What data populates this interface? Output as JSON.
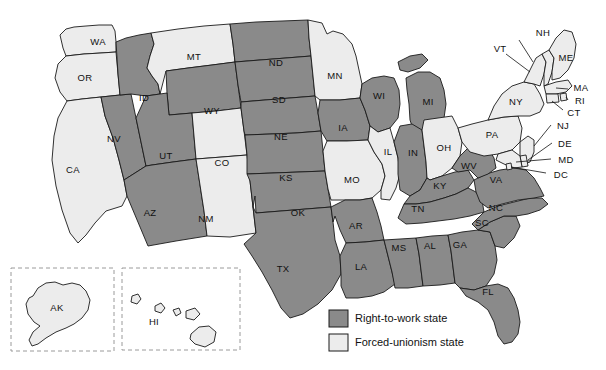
{
  "map": {
    "title": "Right-to-work states map of the United States",
    "colors": {
      "right_to_work": "#8a8a8a",
      "forced_unionism": "#ececec",
      "border": "#1a1a1a"
    },
    "legend": {
      "items": [
        {
          "label": "Right-to-work state",
          "color": "#8a8a8a"
        },
        {
          "label": "Forced-unionism state",
          "color": "#ececec"
        }
      ]
    },
    "insets": [
      {
        "name": "AK"
      },
      {
        "name": "HI"
      }
    ],
    "states": [
      {
        "code": "WA",
        "status": "forced"
      },
      {
        "code": "OR",
        "status": "forced"
      },
      {
        "code": "CA",
        "status": "forced"
      },
      {
        "code": "NV",
        "status": "rtw"
      },
      {
        "code": "ID",
        "status": "rtw"
      },
      {
        "code": "MT",
        "status": "forced"
      },
      {
        "code": "WY",
        "status": "rtw"
      },
      {
        "code": "UT",
        "status": "rtw"
      },
      {
        "code": "AZ",
        "status": "rtw"
      },
      {
        "code": "CO",
        "status": "forced"
      },
      {
        "code": "NM",
        "status": "forced"
      },
      {
        "code": "ND",
        "status": "rtw"
      },
      {
        "code": "SD",
        "status": "rtw"
      },
      {
        "code": "NE",
        "status": "rtw"
      },
      {
        "code": "KS",
        "status": "rtw"
      },
      {
        "code": "OK",
        "status": "rtw"
      },
      {
        "code": "TX",
        "status": "rtw"
      },
      {
        "code": "MN",
        "status": "forced"
      },
      {
        "code": "IA",
        "status": "rtw"
      },
      {
        "code": "MO",
        "status": "forced"
      },
      {
        "code": "AR",
        "status": "rtw"
      },
      {
        "code": "LA",
        "status": "rtw"
      },
      {
        "code": "WI",
        "status": "rtw"
      },
      {
        "code": "IL",
        "status": "forced"
      },
      {
        "code": "MS",
        "status": "rtw"
      },
      {
        "code": "AL",
        "status": "rtw"
      },
      {
        "code": "MI",
        "status": "rtw"
      },
      {
        "code": "IN",
        "status": "rtw"
      },
      {
        "code": "OH",
        "status": "forced"
      },
      {
        "code": "KY",
        "status": "rtw"
      },
      {
        "code": "TN",
        "status": "rtw"
      },
      {
        "code": "GA",
        "status": "rtw"
      },
      {
        "code": "FL",
        "status": "rtw"
      },
      {
        "code": "SC",
        "status": "rtw"
      },
      {
        "code": "NC",
        "status": "rtw"
      },
      {
        "code": "VA",
        "status": "rtw"
      },
      {
        "code": "WV",
        "status": "rtw"
      },
      {
        "code": "PA",
        "status": "forced"
      },
      {
        "code": "NY",
        "status": "forced"
      },
      {
        "code": "VT",
        "status": "forced"
      },
      {
        "code": "NH",
        "status": "forced"
      },
      {
        "code": "ME",
        "status": "forced"
      },
      {
        "code": "MA",
        "status": "forced"
      },
      {
        "code": "RI",
        "status": "forced"
      },
      {
        "code": "CT",
        "status": "forced"
      },
      {
        "code": "NJ",
        "status": "forced"
      },
      {
        "code": "DE",
        "status": "forced"
      },
      {
        "code": "MD",
        "status": "forced"
      },
      {
        "code": "DC",
        "status": "forced"
      },
      {
        "code": "AK",
        "status": "forced"
      },
      {
        "code": "HI",
        "status": "forced"
      }
    ],
    "labels": {
      "WA": "WA",
      "OR": "OR",
      "CA": "CA",
      "NV": "NV",
      "ID": "ID",
      "MT": "MT",
      "WY": "WY",
      "UT": "UT",
      "AZ": "AZ",
      "CO": "CO",
      "NM": "NM",
      "ND": "ND",
      "SD": "SD",
      "NE": "NE",
      "KS": "KS",
      "OK": "OK",
      "TX": "TX",
      "MN": "MN",
      "IA": "IA",
      "MO": "MO",
      "AR": "AR",
      "LA": "LA",
      "WI": "WI",
      "IL": "IL",
      "MS": "MS",
      "AL": "AL",
      "MI": "MI",
      "IN": "IN",
      "OH": "OH",
      "KY": "KY",
      "TN": "TN",
      "GA": "GA",
      "FL": "FL",
      "SC": "SC",
      "NC": "NC",
      "VA": "VA",
      "WV": "WV",
      "PA": "PA",
      "NY": "NY",
      "VT": "VT",
      "NH": "NH",
      "ME": "ME",
      "MA": "MA",
      "RI": "RI",
      "CT": "CT",
      "NJ": "NJ",
      "DE": "DE",
      "MD": "MD",
      "DC": "DC",
      "AK": "AK",
      "HI": "HI"
    }
  }
}
